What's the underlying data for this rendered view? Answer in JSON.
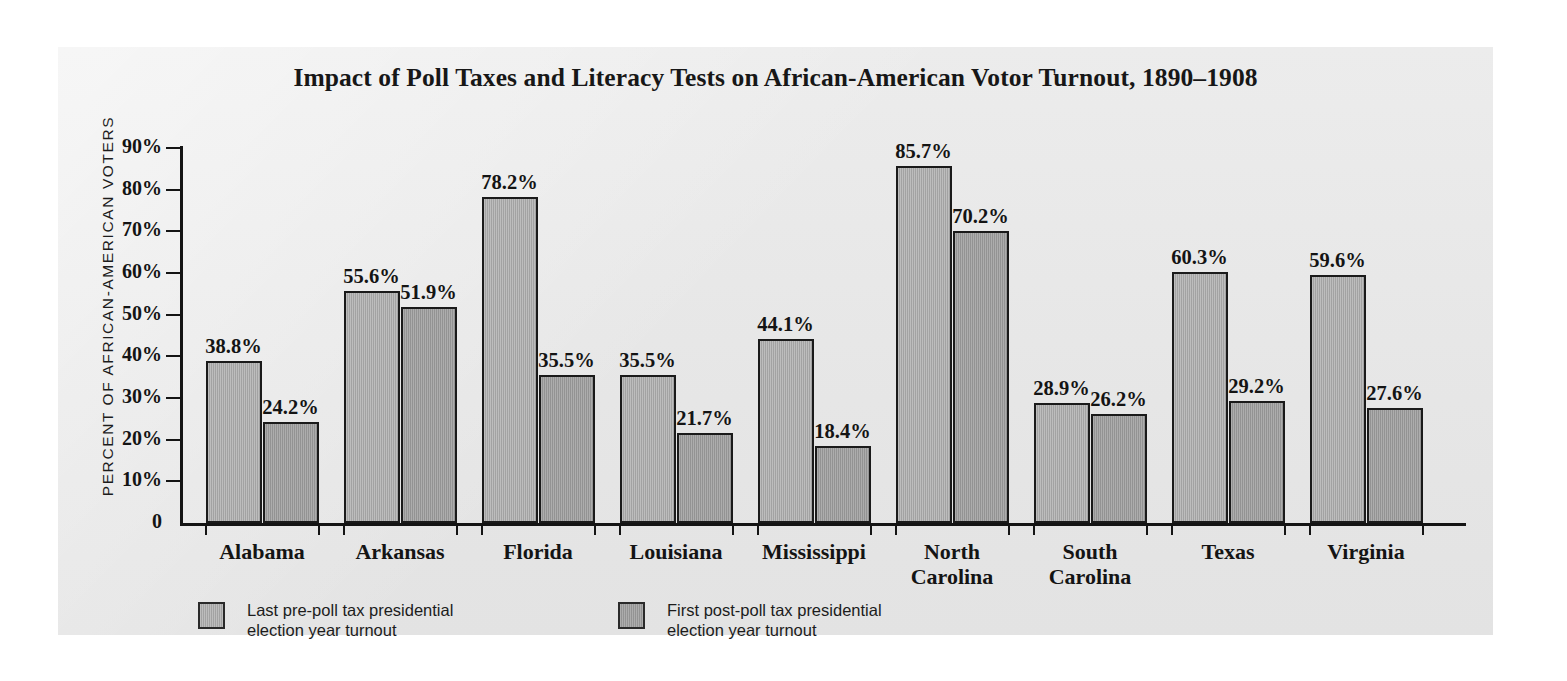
{
  "chart_data": {
    "type": "bar",
    "title": "Impact of Poll Taxes and Literacy Tests on African-American Votor Turnout, 1890–1908",
    "xlabel": "",
    "ylabel": "PERCENT OF AFRICAN-AMERICAN VOTERS",
    "ylim": [
      0,
      90
    ],
    "ytick_labels": [
      "0",
      "10%",
      "20%",
      "30%",
      "40%",
      "50%",
      "60%",
      "70%",
      "80%",
      "90%"
    ],
    "ytick_values": [
      0,
      10,
      20,
      30,
      40,
      50,
      60,
      70,
      80,
      90
    ],
    "grid": false,
    "legend_position": "below-axis-left",
    "categories": [
      "Alabama",
      "Arkansas",
      "Florida",
      "Louisiana",
      "Mississippi",
      "North\nCarolina",
      "South\nCarolina",
      "Texas",
      "Virginia"
    ],
    "series": [
      {
        "name": "Last pre-poll tax presidential\nelection year turnout",
        "color": "#ababab",
        "values": [
          38.8,
          55.6,
          78.2,
          35.5,
          44.1,
          85.7,
          28.9,
          60.3,
          59.6
        ],
        "labels": [
          "38.8%",
          "55.6%",
          "78.2%",
          "35.5%",
          "44.1%",
          "85.7%",
          "28.9%",
          "60.3%",
          "59.6%"
        ]
      },
      {
        "name": "First post-poll tax presidential\nelection year turnout",
        "color": "#9c9c9c",
        "values": [
          24.2,
          51.9,
          35.5,
          21.7,
          18.4,
          70.2,
          26.2,
          29.2,
          27.6
        ],
        "labels": [
          "24.2%",
          "51.9%",
          "35.5%",
          "21.7%",
          "18.4%",
          "70.2%",
          "26.2%",
          "29.2%",
          "27.6%"
        ]
      }
    ]
  },
  "legend": {
    "entries": [
      {
        "label": "Last pre-poll tax presidential\nelection year turnout",
        "swatch": "pre"
      },
      {
        "label": "First post-poll tax presidential\nelection year turnout",
        "swatch": "post"
      }
    ]
  },
  "colors": {
    "panel_background": "#e9e9e9",
    "axis": "#141414",
    "text": "#141414",
    "bar_pre": "#ababab",
    "bar_post": "#9c9c9c"
  }
}
